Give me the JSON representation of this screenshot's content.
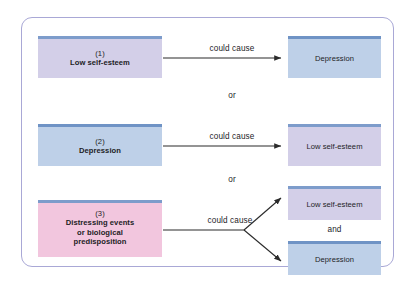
{
  "diagram": {
    "colors": {
      "frame_border": "#a9a8d6",
      "purple_fill": "#d3cfe8",
      "blue_fill": "#bed0e8",
      "pink_fill": "#f2c6de",
      "accent_bar": "#7d9ccb",
      "arrow": "#2b2b2b",
      "text": "#1d1d1f"
    },
    "rows": [
      {
        "number": "(1)",
        "source_label": "Low self-esteem",
        "source_color": "purple",
        "connector": "could cause",
        "targets": [
          {
            "label": "Depression",
            "color": "blue"
          }
        ]
      },
      {
        "number": "(2)",
        "source_label": "Depression",
        "source_color": "blue",
        "connector": "could cause",
        "targets": [
          {
            "label": "Low self-esteem",
            "color": "purple"
          }
        ]
      },
      {
        "number": "(3)",
        "source_label_line1": "Distressing events",
        "source_label_line2": "or biological",
        "source_label_line3": "predisposition",
        "source_color": "pink",
        "connector": "could cause",
        "targets": [
          {
            "label": "Low self-esteem",
            "color": "purple"
          },
          {
            "label": "Depression",
            "color": "blue"
          }
        ],
        "target_conjunction": "and"
      }
    ],
    "separators": {
      "or_1": "or",
      "or_2": "or"
    }
  }
}
